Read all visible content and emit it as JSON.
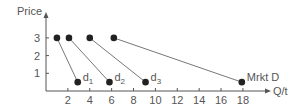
{
  "chart_data": {
    "type": "line",
    "title": "",
    "xlabel": "Q/t",
    "ylabel": "Price",
    "x_ticks": [
      2,
      4,
      6,
      8,
      10,
      12,
      14,
      16,
      18
    ],
    "y_ticks": [
      1,
      2,
      3
    ],
    "xlim": [
      0,
      20
    ],
    "ylim": [
      0,
      3.6
    ],
    "grid": false,
    "legend": "inline labels at line endpoints",
    "series": [
      {
        "name": "d1",
        "sub": "1",
        "base": "d",
        "points": [
          [
            1,
            3
          ],
          [
            2.9,
            0.5
          ]
        ]
      },
      {
        "name": "d2",
        "sub": "2",
        "base": "d",
        "points": [
          [
            2.1,
            3
          ],
          [
            5.8,
            0.5
          ]
        ]
      },
      {
        "name": "d3",
        "sub": "3",
        "base": "d",
        "points": [
          [
            4,
            3
          ],
          [
            9.1,
            0.5
          ]
        ]
      },
      {
        "name": "Mrkt D",
        "sub": "",
        "base": "Mrkt D",
        "points": [
          [
            6.2,
            3
          ],
          [
            17.9,
            0.5
          ]
        ]
      }
    ],
    "colors": {
      "line": "#777777",
      "point": "#222222",
      "axis": "#555555",
      "text": "#555555"
    }
  }
}
